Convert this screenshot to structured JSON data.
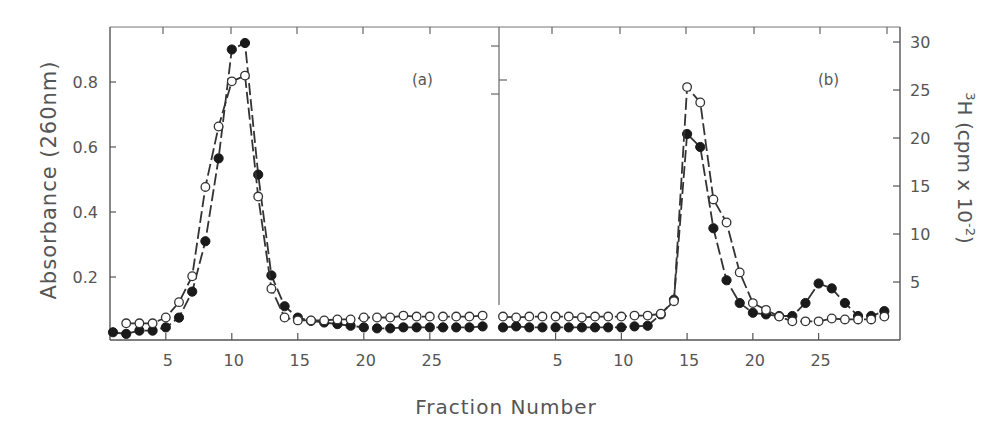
{
  "chart_data": {
    "type": "line",
    "title": "",
    "xlabel": "Fraction Number",
    "ylabel_left": "Absorbance (260nm)",
    "ylabel_right": "3H (cpm x 10-2)",
    "ylabel_right_parts": {
      "sup": "3",
      "main": "H (cpm x 10",
      "exp": "-2",
      "close": ")"
    },
    "ylim_left": [
      0,
      0.95
    ],
    "ylim_right": [
      0,
      31
    ],
    "yticks_left": [
      "0.2",
      "0.4",
      "0.6",
      "0.8"
    ],
    "yticks_right": [
      "5",
      "10",
      "15",
      "20",
      "25",
      "30"
    ],
    "grid": false,
    "legend": "none",
    "markers": {
      "filled_circle": "Absorbance (260nm)",
      "open_circle": "3H (cpm x 10-2)"
    },
    "panels": [
      {
        "label": "(a)",
        "xticks": [
          "5",
          "10",
          "15",
          "20",
          "25"
        ],
        "x": [
          1,
          2,
          3,
          4,
          5,
          6,
          7,
          8,
          9,
          10,
          11,
          12,
          13,
          14,
          15,
          16,
          17,
          18,
          19,
          20,
          21,
          22,
          23,
          24,
          25,
          26,
          27,
          28,
          29
        ],
        "series": [
          {
            "name": "Absorbance (260nm)",
            "marker": "filled",
            "axis": "left",
            "values": [
              0.03,
              0.025,
              0.035,
              0.035,
              0.045,
              0.075,
              0.155,
              0.31,
              0.565,
              0.9,
              0.92,
              0.515,
              0.205,
              0.11,
              0.075,
              0.065,
              0.06,
              0.055,
              0.05,
              0.045,
              0.042,
              0.042,
              0.045,
              0.045,
              0.045,
              0.045,
              0.045,
              0.045,
              0.048
            ]
          },
          {
            "name": "3H (cpm x 10-2)",
            "marker": "open",
            "axis": "right",
            "values": [
              null,
              0.7,
              0.7,
              0.7,
              1.3,
              2.9,
              5.6,
              14.9,
              21.2,
              25.9,
              26.5,
              13.9,
              4.3,
              1.3,
              1.0,
              1.0,
              1.0,
              1.1,
              1.1,
              1.3,
              1.3,
              1.3,
              1.5,
              1.4,
              1.4,
              1.4,
              1.4,
              1.4,
              1.5
            ]
          }
        ]
      },
      {
        "label": "(b)",
        "xticks": [
          "5",
          "10",
          "15",
          "20",
          "25"
        ],
        "x": [
          1,
          2,
          3,
          4,
          5,
          6,
          7,
          8,
          9,
          10,
          11,
          12,
          13,
          14,
          15,
          16,
          17,
          18,
          19,
          20,
          21,
          22,
          23,
          24,
          25,
          26,
          27,
          28,
          29,
          30
        ],
        "series": [
          {
            "name": "Absorbance (260nm)",
            "marker": "filled",
            "axis": "left",
            "values": [
              0.045,
              0.048,
              0.045,
              0.045,
              0.045,
              0.045,
              0.045,
              0.045,
              0.045,
              0.045,
              0.048,
              0.05,
              0.085,
              0.13,
              0.64,
              0.6,
              0.35,
              0.19,
              0.12,
              0.09,
              0.085,
              0.08,
              0.08,
              0.12,
              0.18,
              0.165,
              0.12,
              0.08,
              0.08,
              0.095
            ]
          },
          {
            "name": "3H (cpm x 10-2)",
            "marker": "open",
            "axis": "right",
            "values": [
              1.4,
              1.3,
              1.4,
              1.4,
              1.4,
              1.4,
              1.3,
              1.4,
              1.4,
              1.4,
              1.5,
              1.5,
              1.7,
              3.0,
              25.3,
              23.7,
              13.6,
              11.2,
              6.0,
              2.8,
              2.1,
              1.4,
              0.9,
              0.9,
              0.9,
              1.2,
              1.1,
              1.1,
              1.1,
              1.4
            ]
          }
        ]
      }
    ]
  },
  "labels": {
    "panel_a": "(a)",
    "panel_b": "(b)",
    "xlabel": "Fraction Number",
    "ylabel_left": "Absorbance (260nm)"
  }
}
